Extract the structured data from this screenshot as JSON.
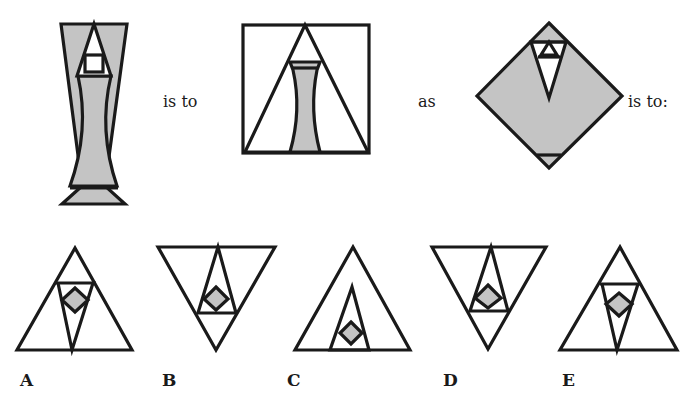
{
  "puzzle": {
    "type": "visual analogy",
    "connectors": {
      "is_to_1": "is to",
      "as": "as",
      "is_to_2": "is to:"
    },
    "colors": {
      "shade": "#c4c4c4",
      "stroke": "#1a1a1a",
      "background": "#ffffff"
    },
    "stem": [
      {
        "id": "figure-1",
        "description": "Tall shaded hourglass column with triangle and small square at top, bar near bottom"
      },
      {
        "id": "figure-2",
        "description": "Square containing a large triangle with a small shaded hourglass inside"
      },
      {
        "id": "figure-3",
        "description": "Shaded diamond containing inverted triangle with small triangles at top and bar at bottom tip"
      }
    ],
    "options": [
      {
        "label": "A",
        "description": "Upright triangle with inverted inner triangle and shaded diamond"
      },
      {
        "label": "B",
        "description": "Inverted triangle with upright inner triangle and shaded diamond"
      },
      {
        "label": "C",
        "description": "Upright triangle with tall narrow inner triangle and shaded diamond at base"
      },
      {
        "label": "D",
        "description": "Inverted triangle with upright inner triangle and shaded diamond"
      },
      {
        "label": "E",
        "description": "Upright triangle with inverted inner triangle and shaded diamond with small triangle on top"
      }
    ]
  }
}
